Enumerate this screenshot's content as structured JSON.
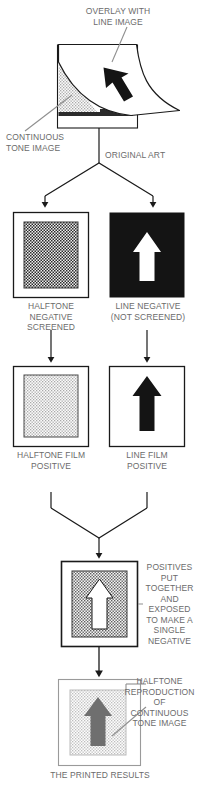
{
  "figure": {
    "type": "process-diagram",
    "bottom_caption": "THE PRINTED RESULTS"
  },
  "colors": {
    "ink_black": "#111111",
    "paper_white": "#ffffff",
    "label_gray": "#6b6b6b",
    "halftone_gray": "#9a9a9a",
    "light_gray_panel": "#d8d8d8",
    "mid_gray_arrow": "#767676",
    "line_stroke": "#1a1a1a",
    "leader_gray": "#8a8a8a"
  },
  "labels": {
    "overlay_with_line_image": "OVERLAY WITH\nLINE IMAGE",
    "continuous_tone_image": "CONTINUOUS\nTONE IMAGE",
    "original_art": "ORIGINAL ART",
    "halftone_negative_screened": "HALFTONE\nNEGATIVE\nSCREENED",
    "line_negative_not_screened": "LINE NEGATIVE\n(NOT SCREENED)",
    "halftone_film_positive": "HALFTONE FILM\nPOSITIVE",
    "line_film_positive": "LINE FILM\nPOSITIVE",
    "positives_put_together": "POSITIVES\nPUT\nTOGETHER\nAND\nEXPOSED\nTO MAKE A\nSINGLE\nNEGATIVE",
    "halftone_reproduction": "HALFTONE\nREPRODUCTION\nOF\nCONTINUOUS\nTONE IMAGE",
    "the_printed_results": "THE PRINTED RESULTS"
  },
  "stages": [
    {
      "id": "original-art",
      "caption": "ORIGINAL ART",
      "annotations": [
        "OVERLAY WITH\nLINE IMAGE",
        "CONTINUOUS\nTONE IMAGE"
      ]
    },
    {
      "id": "halftone-negative",
      "caption": "HALFTONE\nNEGATIVE\nSCREENED",
      "content": "screened halftone block"
    },
    {
      "id": "line-negative",
      "caption": "LINE NEGATIVE\n(NOT SCREENED)",
      "content": "white arrow on solid black"
    },
    {
      "id": "halftone-film-positive",
      "caption": "HALFTONE FILM\nPOSITIVE",
      "content": "light screened halftone block"
    },
    {
      "id": "line-film-positive",
      "caption": "LINE FILM\nPOSITIVE",
      "content": "black arrow on white"
    },
    {
      "id": "combined-negative",
      "caption": "POSITIVES\nPUT\nTOGETHER\nAND\nEXPOSED\nTO MAKE A\nSINGLE\nNEGATIVE",
      "content": "white arrow knocked out of screened halftone block"
    },
    {
      "id": "printed-results",
      "caption": "THE PRINTED RESULTS",
      "annotations": [
        "HALFTONE\nREPRODUCTION\nOF\nCONTINUOUS\nTONE IMAGE"
      ],
      "content": "gray arrow on light halftone block"
    }
  ]
}
